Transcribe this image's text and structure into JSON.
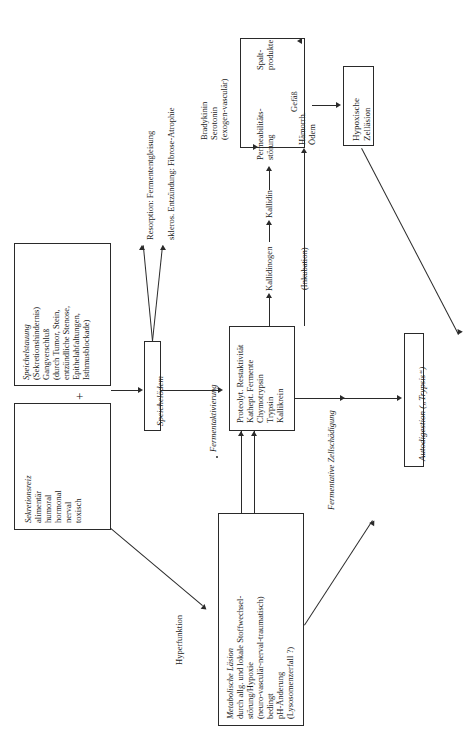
{
  "figure": {
    "orientation": "rotated-90-ccw",
    "kind": "flow-diagram",
    "plus_symbol": "+",
    "boxes": {
      "speichelstauung": {
        "lines": [
          "Speichelstauung",
          "(Sekretionshindernis)",
          "Gangverschluß",
          "(durch Tumor, Stein,",
          "entzündliche Stenose,",
          "Epithelabfaltungen,",
          "Isthmusblockade)"
        ],
        "italic_first_line": true
      },
      "sekretionsreiz": {
        "lines": [
          "Sekretionsreiz",
          "alimentär",
          "humoral",
          "hormonal",
          "nerval",
          "toxisch"
        ],
        "italic_first_line": true
      },
      "speichueloedem": {
        "lines": [
          "Speichelödem"
        ],
        "italic_first_line": true
      },
      "fermente": {
        "lines": [
          "Proteolyt. Restaktivität",
          "Kathept. Fermente",
          "Chymotrypsin",
          "Trypsin",
          "Kallikrein"
        ],
        "italic_first_line": false
      },
      "metabolische_laesion": {
        "lines": [
          "Metabolische Läsion",
          "durch allg. und lokale Stoffwechsel-",
          "störung/Hypoxie",
          "(neuro-vasculär-nerval-traumatisch)",
          "bedingt",
          "pH-Änderung",
          "(Lysosomenzerfall ?)"
        ],
        "italic_first_line": true
      },
      "hypoxische_zellaesion": {
        "lines": [
          "Hypoxische",
          "Zelläsion"
        ],
        "italic_first_line": false
      },
      "autodigestion": {
        "lines": [
          "Autodigestion („Trypsis“)"
        ],
        "italic_first_line": true
      }
    },
    "labels": {
      "resorption": "Resorption: Fermententgleisung",
      "skleros": "skleros. Entzündung: Fibrose-Atrophie",
      "fermentaktivierung": "Fermentaktivierung",
      "hyperfunktion": "Hyperfunktion",
      "bradykinin": "Bradykinin",
      "serotonin": "Serotonin",
      "exogen_vasculaer": "(exogen-vasculär)",
      "kallidinogen": "Kallidinogen",
      "kallidin": "Kallidin",
      "permeabilitaet_l1": "Permeabilitäts-",
      "permeabilitaet_l2": "störung",
      "spalt_l1": "Spalt-",
      "spalt_l2": "produkte",
      "gefaess": "Gefäß",
      "haemorrh_l1": "Hämorrh.",
      "haemorrh_l2": "Ödem",
      "inkubation": "(Inkubation)",
      "fermentative": "Fermentative Zellschädigung"
    },
    "colors": {
      "ink": "#1a1a1a",
      "stroke": "#2a2a2a",
      "paper": "#ffffff"
    }
  }
}
